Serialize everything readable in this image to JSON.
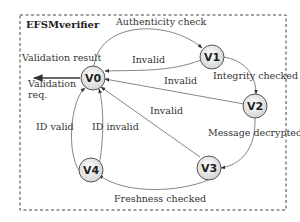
{
  "diagram": {
    "title": "EFSMverifier",
    "colors": {
      "border": "#444444",
      "edge": "#555555",
      "node_fill_center": "#ffffff",
      "node_fill_edge": "#d9d9d9",
      "text": "#333333"
    },
    "nodes": [
      {
        "id": "V0",
        "label": "V0"
      },
      {
        "id": "V1",
        "label": "V1"
      },
      {
        "id": "V2",
        "label": "V2"
      },
      {
        "id": "V3",
        "label": "V3"
      },
      {
        "id": "V4",
        "label": "V4"
      }
    ],
    "edges": [
      {
        "from": "V0",
        "to": "V1",
        "label": "Authenticity check"
      },
      {
        "from": "V1",
        "to": "V0",
        "label": "Invalid"
      },
      {
        "from": "V1",
        "to": "V2",
        "label": "Integrity checked"
      },
      {
        "from": "V2",
        "to": "V0",
        "label": "Invalid"
      },
      {
        "from": "V2",
        "to": "V3",
        "label": "Message decrypted"
      },
      {
        "from": "V3",
        "to": "V0",
        "label": "Invalid"
      },
      {
        "from": "V3",
        "to": "V4",
        "label": "Freshness checked"
      },
      {
        "from": "V4",
        "to": "V0",
        "label": "ID valid"
      },
      {
        "from": "V4",
        "to": "V0",
        "label": "ID invalid"
      }
    ],
    "external": {
      "output_label": "Validation result",
      "input_label_line1": "Validation",
      "input_label_line2": "req."
    }
  }
}
